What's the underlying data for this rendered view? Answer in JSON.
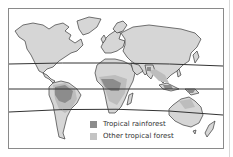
{
  "map": {
    "type": "world map",
    "lines": [
      "tropic-of-cancer",
      "equator",
      "tropic-of-capricorn"
    ],
    "colors": {
      "land": "#d6d6d6",
      "coast": "#3a3a3a",
      "rainforest": "#8c8c8c",
      "other_forest": "#bdbdbd",
      "lines": "#333333"
    }
  },
  "legend": {
    "items": [
      {
        "label": "Tropical rainforest",
        "color": "#8c8c8c"
      },
      {
        "label": "Other tropical forest",
        "color": "#c4c4c4"
      }
    ]
  }
}
